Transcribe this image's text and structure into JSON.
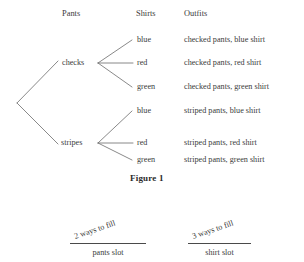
{
  "figure": {
    "caption": "Figure 1",
    "headers": {
      "pants": "Pants",
      "shirts": "Shirts",
      "outfits": "Outfits"
    },
    "pants_nodes": [
      {
        "label": "checks"
      },
      {
        "label": "stripes"
      }
    ],
    "shirt_nodes": [
      {
        "label": "blue"
      },
      {
        "label": "red"
      },
      {
        "label": "green"
      },
      {
        "label": "blue"
      },
      {
        "label": "red"
      },
      {
        "label": "green"
      }
    ],
    "outfits": [
      {
        "text": "checked pants, blue shirt"
      },
      {
        "text": "checked pants, red shirt"
      },
      {
        "text": "checked pants, green shirt"
      },
      {
        "text": "striped pants, blue shirt"
      },
      {
        "text": "striped pants, red shirt"
      },
      {
        "text": "striped pants, green shirt"
      }
    ]
  },
  "slots": [
    {
      "ways": "2 ways to fill",
      "name": "pants slot"
    },
    {
      "ways": "3 ways to fill",
      "name": "shirt slot"
    }
  ],
  "colors": {
    "text": "#3b3b3b",
    "line": "#6b6b6b",
    "rule": "#4a4a4a",
    "background": "#ffffff"
  }
}
